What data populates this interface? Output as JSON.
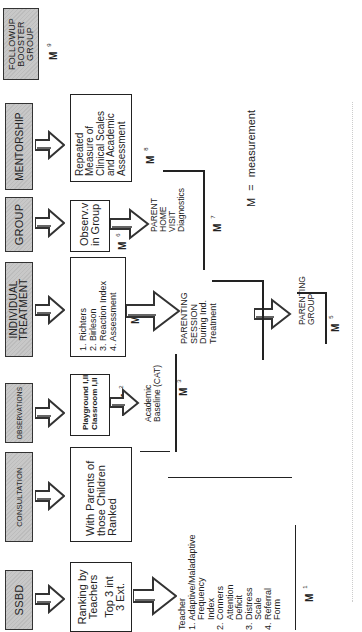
{
  "diagram": {
    "orientation": "rotated 90° counter-clockwise",
    "stages": [
      {
        "id": "ssbd",
        "header": "SSBD",
        "content": [
          "Ranking by",
          "Teachers",
          "",
          "Top 3 int",
          "3 Ext."
        ],
        "measure": "M",
        "measure_index": "1"
      },
      {
        "id": "consultation",
        "header": "CONSULTATION",
        "content": [
          "With Parents of",
          "those Children",
          "Ranked"
        ]
      },
      {
        "id": "observations",
        "header": "OBSERVATIONS",
        "content": [
          "Playground I,II",
          "Classroom I,II"
        ],
        "measure": "M",
        "measure_index": "2"
      },
      {
        "id": "individual_treatment",
        "header_lines": [
          "INDIVIDUAL",
          "TREATMENT"
        ],
        "content": [
          "1.  Richters",
          "2.  Birleson",
          "3.  Reaction Index",
          "4.  Assessment"
        ],
        "measure": "M",
        "measure_index": "4"
      },
      {
        "id": "group",
        "header": "GROUP",
        "content": [
          "Observ.v",
          "in Group"
        ],
        "measure": "M",
        "measure_index": "6"
      },
      {
        "id": "mentorship",
        "header": "MENTORSHIP",
        "content": [
          "Repeated",
          "Measure of",
          "Clinical Scales",
          "and Academic",
          "Assessment"
        ],
        "measure": "M",
        "measure_index": "8"
      },
      {
        "id": "followup",
        "header_lines": [
          "FOLLOWUP",
          "BOOSTER",
          "GROUP"
        ],
        "measure": "M",
        "measure_index": "9"
      }
    ],
    "sub_items": {
      "teacher": {
        "lines": [
          "Teacher",
          "1. Adaptive/Maladaptive",
          "    Frequency",
          "    Index",
          "2. Conners",
          "    Attention",
          "    Deficit",
          "3. Distress",
          "    Scale",
          "4. Referral",
          "    Form"
        ],
        "measure": "M",
        "measure_index": "1"
      },
      "academic": {
        "lines": [
          "Academic",
          "Baseline (CAT)"
        ],
        "measure": "M",
        "measure_index": "3"
      },
      "parenting_session": {
        "lines": [
          "PARENTING",
          "SESSION",
          "During Ind.",
          "Treatment"
        ]
      },
      "parenting_group": {
        "lines": [
          "PARENTING",
          "GROUP"
        ],
        "measure": "M",
        "measure_index": "5"
      },
      "parent_home_visit": {
        "lines": [
          "PARENT",
          "HOME",
          "VISIT",
          "Diagnostics"
        ],
        "measure": "M",
        "measure_index": "7"
      }
    },
    "legend": {
      "symbol": "M",
      "equals": "=",
      "meaning": "measurement"
    },
    "colors": {
      "header_fill": "#c8c8c8",
      "border": "#222222",
      "background": "#ffffff"
    }
  }
}
